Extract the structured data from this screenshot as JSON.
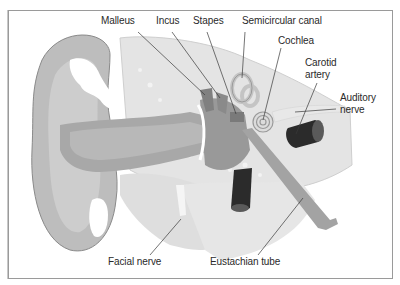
{
  "diagram": {
    "labels": {
      "malleus": "Malleus",
      "incus": "Incus",
      "stapes": "Stapes",
      "semicircular_canal": "Semicircular canal",
      "cochlea": "Cochlea",
      "carotid_artery_line1": "Carotid",
      "carotid_artery_line2": "artery",
      "auditory_nerve_line1": "Auditory",
      "auditory_nerve_line2": "nerve",
      "facial_nerve": "Facial nerve",
      "eustachian_tube": "Eustachian tube"
    },
    "colors": {
      "pinna": "#b9b9b9",
      "pinna_inner": "#cfcfcf",
      "canal": "#a6a6a6",
      "bone": "#e4e4e4",
      "ossicles": "#8f8f8f",
      "soft_tissue": "#dadada",
      "vessel": "#2b2b2b",
      "leader_line": "#3a3a3a",
      "border": "#9a9a9a"
    }
  }
}
